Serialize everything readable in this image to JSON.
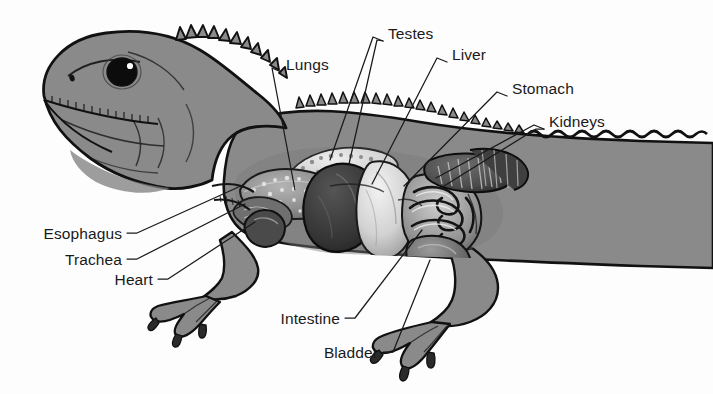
{
  "figure": {
    "title": "",
    "background_color": "#fdfdfd",
    "body_color": "#8a8a8a",
    "body_shadow_color": "#6f6f6f",
    "outline_color": "#111111",
    "label_color": "#1a1a1a",
    "leader_color": "#1a1a1a"
  },
  "labels": [
    {
      "id": "testes",
      "text": "Testes",
      "text_x": 388,
      "text_y": 26,
      "align": "left",
      "leaders": [
        [
          [
            383,
            41
          ],
          [
            373,
            37
          ],
          [
            330,
            160
          ]
        ],
        [
          [
            383,
            41
          ],
          [
            377,
            40
          ],
          [
            349,
            164
          ]
        ]
      ]
    },
    {
      "id": "lungs",
      "text": "Lungs",
      "text_x": 286,
      "text_y": 57,
      "align": "left",
      "leaders": [
        [
          [
            281,
            72
          ],
          [
            272,
            68
          ],
          [
            295,
            190
          ]
        ]
      ]
    },
    {
      "id": "liver",
      "text": "Liver",
      "text_x": 452,
      "text_y": 47,
      "align": "left",
      "leaders": [
        [
          [
            447,
            62
          ],
          [
            437,
            58
          ],
          [
            372,
            184
          ]
        ]
      ]
    },
    {
      "id": "stomach",
      "text": "Stomach",
      "text_x": 512,
      "text_y": 81,
      "align": "left",
      "leaders": [
        [
          [
            507,
            96
          ],
          [
            497,
            92
          ],
          [
            404,
            186
          ]
        ]
      ]
    },
    {
      "id": "kidneys",
      "text": "Kidneys",
      "text_x": 549,
      "text_y": 114,
      "align": "left",
      "leaders": [
        [
          [
            544,
            129
          ],
          [
            534,
            125
          ],
          [
            436,
            178
          ]
        ],
        [
          [
            544,
            129
          ],
          [
            536,
            129
          ],
          [
            444,
            186
          ]
        ]
      ]
    },
    {
      "id": "esophagus",
      "text": "Esophagus",
      "text_x": 122,
      "text_y": 226,
      "align": "right",
      "leaders": [
        [
          [
            127,
            233
          ],
          [
            137,
            233
          ],
          [
            243,
            185
          ]
        ]
      ]
    },
    {
      "id": "trachea",
      "text": "Trachea",
      "text_x": 122,
      "text_y": 252,
      "align": "right",
      "leaders": [
        [
          [
            127,
            259
          ],
          [
            137,
            259
          ],
          [
            245,
            204
          ]
        ]
      ]
    },
    {
      "id": "heart",
      "text": "Heart",
      "text_x": 153,
      "text_y": 272,
      "align": "right",
      "leaders": [
        [
          [
            158,
            279
          ],
          [
            168,
            279
          ],
          [
            255,
            222
          ]
        ]
      ]
    },
    {
      "id": "intestine",
      "text": "Intestine",
      "text_x": 340,
      "text_y": 311,
      "align": "right",
      "leaders": [
        [
          [
            345,
            318
          ],
          [
            355,
            318
          ],
          [
            422,
            230
          ]
        ]
      ]
    },
    {
      "id": "bladder",
      "text": "Bladder",
      "text_x": 378,
      "text_y": 345,
      "align": "right",
      "leaders": [
        [
          [
            383,
            352
          ],
          [
            393,
            352
          ],
          [
            430,
            260
          ]
        ]
      ]
    }
  ]
}
